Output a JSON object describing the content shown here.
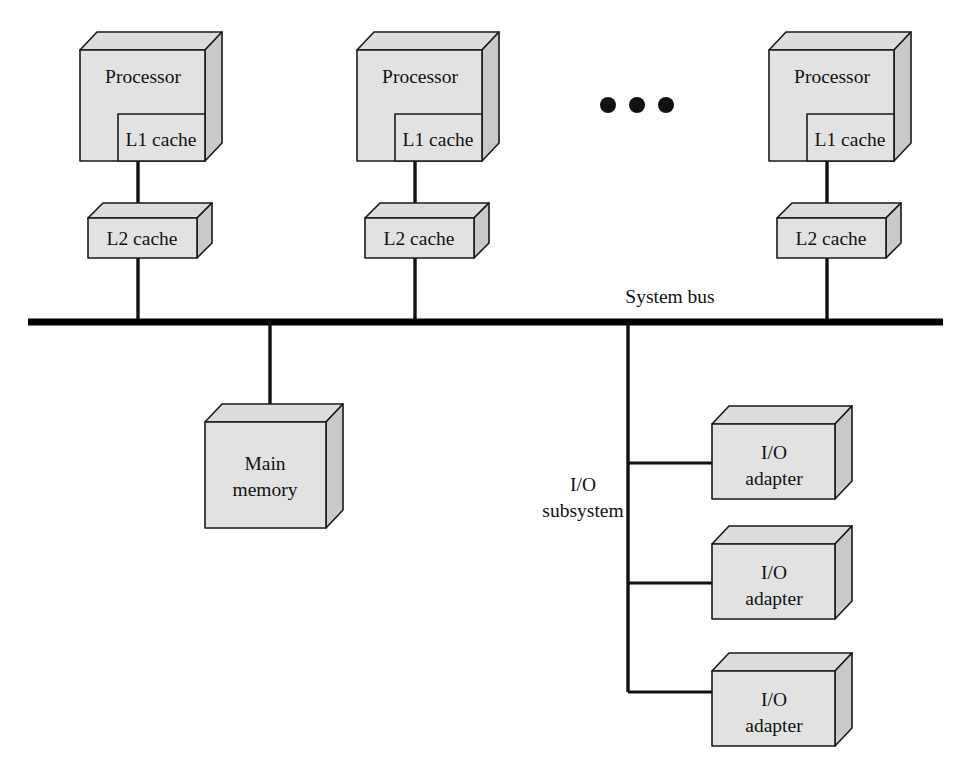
{
  "diagram": {
    "colors": {
      "box_front": "#e2e2e2",
      "box_top": "#dcdcdc",
      "box_side": "#c9c9c9",
      "stroke": "#1a1a1a",
      "bus": "#000000",
      "wire": "#111111",
      "background": "#ffffff"
    },
    "processor_groups": [
      {
        "processor_label": "Processor",
        "l1_label": "L1 cache",
        "l2_label": "L2 cache"
      },
      {
        "processor_label": "Processor",
        "l1_label": "L1 cache",
        "l2_label": "L2 cache"
      },
      {
        "processor_label": "Processor",
        "l1_label": "L1 cache",
        "l2_label": "L2 cache"
      }
    ],
    "ellipsis": {
      "name": "more-processors-ellipsis",
      "dot_count": 3
    },
    "bus": {
      "label": "System bus"
    },
    "main_memory": {
      "line1": "Main",
      "line2": "memory"
    },
    "io_subsystem": {
      "line1": "I/O",
      "line2": "subsystem"
    },
    "io_adapters": [
      {
        "line1": "I/O",
        "line2": "adapter"
      },
      {
        "line1": "I/O",
        "line2": "adapter"
      },
      {
        "line1": "I/O",
        "line2": "adapter"
      }
    ]
  }
}
